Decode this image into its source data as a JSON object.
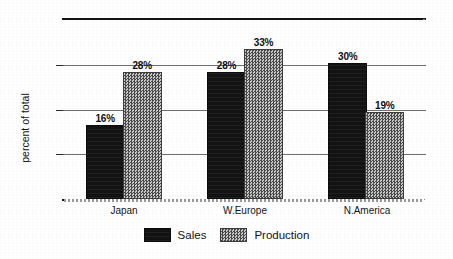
{
  "chart_data": {
    "type": "bar",
    "title": "",
    "subtitle": "",
    "xlabel": "",
    "ylabel": "percent of total",
    "categories": [
      "Japan",
      "W.Europe",
      "N.America"
    ],
    "series": [
      {
        "name": "Sales",
        "values": [
          16,
          28,
          30
        ],
        "labels": [
          "16%",
          "28%",
          "30%"
        ],
        "color": "#121212",
        "fill": "solid-black"
      },
      {
        "name": "Production",
        "values": [
          28,
          33,
          19
        ],
        "labels": [
          "28%",
          "33%",
          "19%"
        ],
        "color": "#8e8e8e",
        "fill": "gray-checker-dither"
      }
    ],
    "value_suffix": "%",
    "ylim": [
      0,
      40
    ],
    "yticks": [
      10,
      20,
      30
    ],
    "ytick_labels": [
      "",
      "",
      ""
    ],
    "grid": true,
    "grid_axis": "y",
    "legend": true,
    "legend_position": "bottom-center",
    "data_labels": true
  },
  "axis": {
    "y_title": "percent of total"
  },
  "legend": {
    "items": [
      {
        "label": "Sales",
        "swatch": "solid-black-swatch"
      },
      {
        "label": "Production",
        "swatch": "gray-dither-swatch"
      }
    ]
  }
}
